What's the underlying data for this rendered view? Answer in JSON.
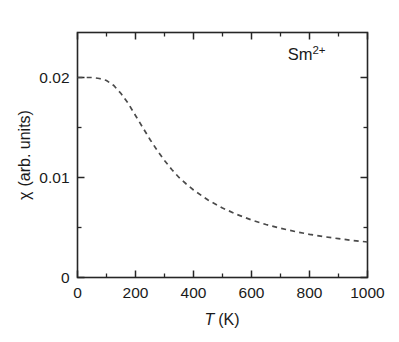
{
  "chart_data": {
    "type": "line",
    "title": "",
    "xlabel": "T (K)",
    "xlabel_symbol": "T",
    "xlabel_unit": "(K)",
    "ylabel": "χ (arb. units)",
    "ylabel_symbol": "χ",
    "ylabel_unit": "(arb. units)",
    "xlim": [
      0,
      1000
    ],
    "ylim": [
      0,
      0.0245
    ],
    "grid": false,
    "legend": "none",
    "annotations": [
      {
        "text": "Sm2+",
        "base": "Sm",
        "superscript": "2+",
        "x": 790,
        "y": 0.0218
      }
    ],
    "xticks": [
      0,
      200,
      400,
      600,
      800,
      1000
    ],
    "xtick_labels": [
      "0",
      "200",
      "400",
      "600",
      "800",
      "1000"
    ],
    "xticks_minor": [
      100,
      300,
      500,
      700,
      900
    ],
    "yticks": [
      0,
      0.01,
      0.02
    ],
    "ytick_labels": [
      "0",
      "0.01",
      "0.02"
    ],
    "yticks_minor": [
      0.005,
      0.015
    ],
    "line_style": "dashed",
    "line_color": "#4a4a4a",
    "series": [
      {
        "name": "Sm2+ susceptibility",
        "x": [
          0,
          25,
          50,
          75,
          100,
          125,
          150,
          175,
          200,
          225,
          250,
          275,
          300,
          325,
          350,
          375,
          400,
          450,
          500,
          550,
          600,
          650,
          700,
          750,
          800,
          850,
          900,
          950,
          1000
        ],
        "values": [
          0.02,
          0.02,
          0.02,
          0.0199,
          0.0197,
          0.0192,
          0.0184,
          0.0174,
          0.0162,
          0.015,
          0.0138,
          0.0127,
          0.0117,
          0.0108,
          0.01,
          0.00935,
          0.00875,
          0.00775,
          0.00695,
          0.0063,
          0.00575,
          0.0053,
          0.00492,
          0.0046,
          0.00432,
          0.00408,
          0.00388,
          0.0037,
          0.00355
        ]
      }
    ]
  },
  "figure": {
    "background_color": "#ffffff",
    "axis_color": "#262626",
    "text_color": "#1a1a1a"
  }
}
